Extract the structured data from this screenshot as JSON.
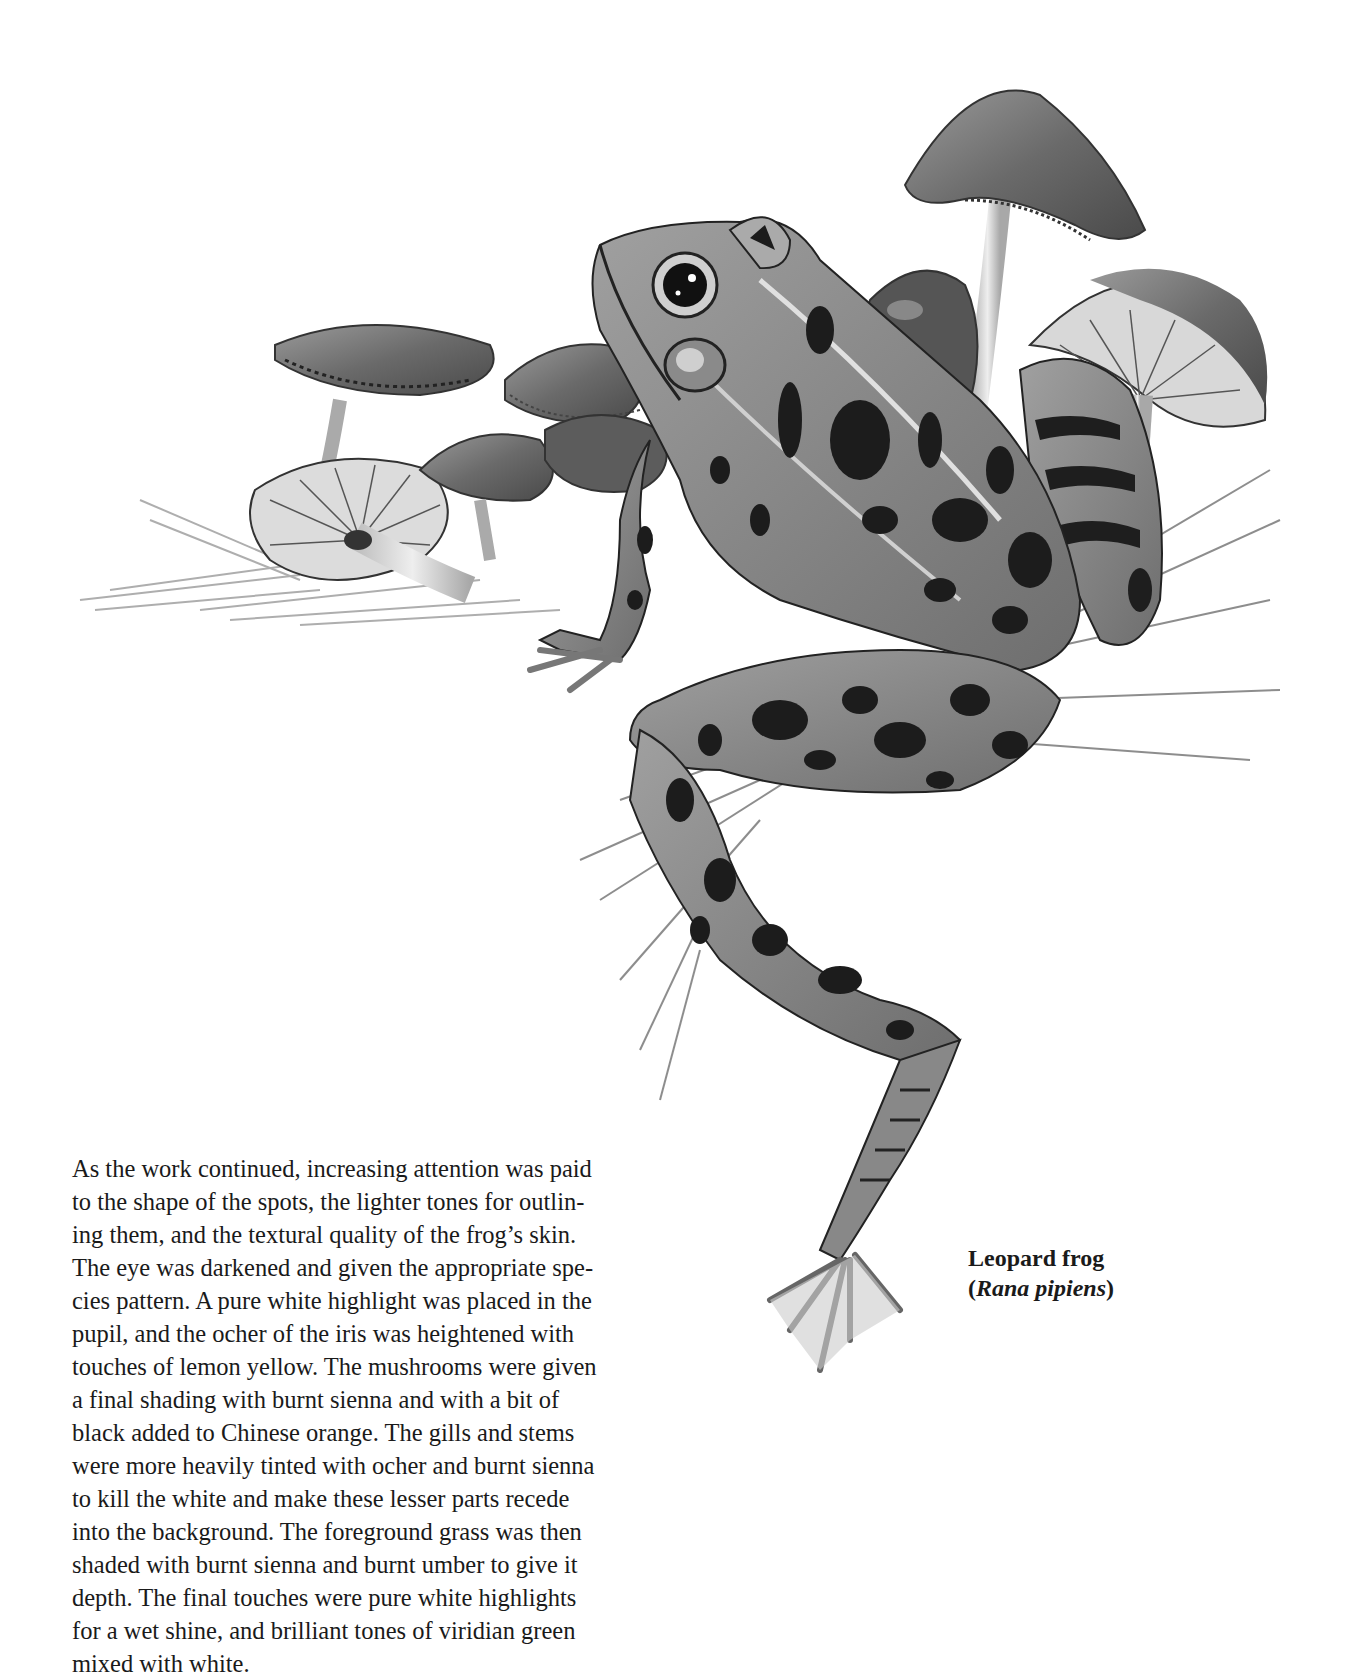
{
  "illustration": {
    "subject": "Leopard frog among mushrooms and grass",
    "style": "grayscale painted illustration",
    "colors": {
      "dark": "#1c1c1c",
      "mid": "#777777",
      "light": "#c8c8c8",
      "paper": "#ffffff"
    }
  },
  "caption": {
    "common_name": "Leopard frog",
    "open_paren": "(",
    "scientific_name": "Rana pipiens",
    "close_paren": ")"
  },
  "body_text": {
    "lines": [
      "As the work continued, increasing attention was paid",
      "to the shape of the spots, the lighter tones for outlin-",
      "ing them, and the textural quality of the frog’s skin.",
      "The eye was darkened and given the appropriate spe-",
      "cies pattern. A pure white highlight was placed in the",
      "pupil, and the ocher of the iris was heightened with",
      "touches of lemon yellow. The mushrooms were given",
      "a final shading with burnt sienna and with a bit of",
      "black added to Chinese orange. The gills and stems",
      "were more heavily tinted with ocher and burnt sienna",
      "to kill the white and make these lesser parts recede",
      "into the background. The foreground grass was then",
      "shaded with burnt sienna and burnt umber to give it",
      "depth. The final touches were pure white highlights",
      "for a wet shine, and brilliant tones of viridian green",
      "mixed with white."
    ]
  }
}
